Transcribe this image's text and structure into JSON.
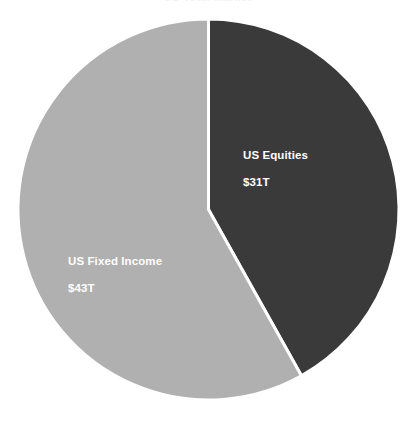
{
  "chart_data": {
    "type": "pie",
    "title": "",
    "xlabel": "",
    "ylabel": "",
    "unit": "T",
    "currency": "$",
    "total": 74,
    "categories": [
      "US Equities",
      "US Fixed Income"
    ],
    "values": [
      31,
      43
    ],
    "percentages": [
      41.9,
      58.1
    ],
    "labels": [
      "$31T",
      "$43T"
    ],
    "colors": [
      "#3a3a3a",
      "#b0b0b0"
    ],
    "start_angle_deg": 0,
    "direction": "clockwise",
    "legend": "none",
    "grid": false,
    "data_labels_inside": true,
    "slices": [
      {
        "name": "US Equities",
        "value": 31,
        "value_label": "$31T",
        "percent": 41.9,
        "color": "#3a3a3a",
        "start_deg": 0,
        "end_deg": 150.8
      },
      {
        "name": "US Fixed Income",
        "value": 43,
        "value_label": "$43T",
        "percent": 58.1,
        "color": "#b0b0b0",
        "start_deg": 150.8,
        "end_deg": 360
      }
    ]
  },
  "figure": {
    "title_cropped": "US Total Market",
    "background": "#ffffff",
    "separator_color": "#ffffff",
    "label_text_color": "#ffffff"
  }
}
